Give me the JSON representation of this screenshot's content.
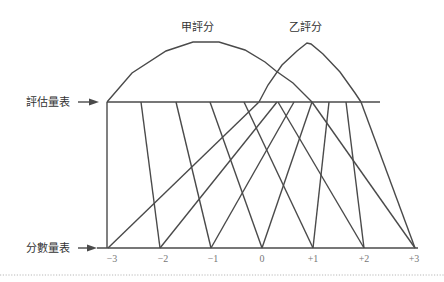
{
  "diagram": {
    "curve_labels": {
      "a": "甲評分",
      "b": "乙評分"
    },
    "scales": {
      "top": "評估量表",
      "bottom": "分數量表"
    },
    "ticks": [
      "−3",
      "−2",
      "−1",
      "0",
      "+1",
      "+2",
      "+3"
    ],
    "colors": {
      "line": "#4a4a4a",
      "label": "#333333",
      "tick": "#777777"
    }
  }
}
